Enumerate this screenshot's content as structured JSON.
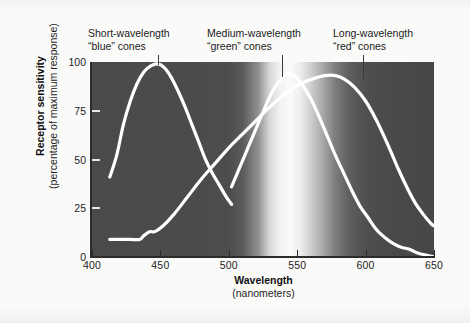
{
  "figure": {
    "background_color": "#fafaf9",
    "plot_background_dark": "#4a4a4a",
    "curve_color": "#ffffff"
  },
  "axes": {
    "x": {
      "title": "Wavelength",
      "subtitle": "(nanometers)",
      "ticks": [
        {
          "value": 400,
          "label": "400"
        },
        {
          "value": 450,
          "label": "450"
        },
        {
          "value": 500,
          "label": "500"
        },
        {
          "value": 550,
          "label": "550"
        },
        {
          "value": 600,
          "label": "600"
        },
        {
          "value": 650,
          "label": "650"
        }
      ],
      "range": [
        400,
        650
      ]
    },
    "y": {
      "title": "Receptor sensitivity",
      "subtitle": "(percentage of maximum response)",
      "ticks": [
        {
          "value": 0,
          "label": "0"
        },
        {
          "value": 25,
          "label": "25"
        },
        {
          "value": 50,
          "label": "50"
        },
        {
          "value": 75,
          "label": "75"
        },
        {
          "value": 100,
          "label": "100"
        }
      ],
      "range": [
        0,
        100
      ]
    }
  },
  "annotations": [
    {
      "id": "blue",
      "line1": "Short-wavelength",
      "line2": "“blue” cones",
      "text_left": 88,
      "text_top": 27,
      "leader_x": 158,
      "leader_top": 55,
      "leader_height": 10
    },
    {
      "id": "green",
      "line1": "Medium-wavelength",
      "line2": "“green” cones",
      "text_left": 207,
      "text_top": 27,
      "leader_x": 282,
      "leader_top": 55,
      "leader_height": 22
    },
    {
      "id": "red",
      "line1": "Long-wavelength",
      "line2": "“red” cones",
      "text_left": 333,
      "text_top": 27,
      "leader_x": 363,
      "leader_top": 55,
      "leader_height": 24
    }
  ],
  "chart_data": {
    "type": "line",
    "title": "",
    "xlabel": "Wavelength (nanometers)",
    "ylabel": "Receptor sensitivity (percentage of maximum response)",
    "xlim": [
      400,
      650
    ],
    "ylim": [
      0,
      100
    ],
    "grid": false,
    "legend_position": "annotations-above-plot",
    "background": "spectrum-grayscale-gradient",
    "series": [
      {
        "name": "Short-wavelength “blue” cones",
        "color": "#ffffff",
        "x": [
          413,
          418,
          423,
          428,
          433,
          438,
          443,
          448,
          453,
          458,
          463,
          468,
          473,
          478,
          483,
          488,
          493,
          498,
          502
        ],
        "y": [
          41,
          52,
          68,
          80,
          89,
          95,
          98,
          99,
          97,
          92,
          85,
          77,
          68,
          59,
          50,
          43,
          37,
          31,
          27
        ]
      },
      {
        "name": "Medium-wavelength “green” cones",
        "color": "#ffffff",
        "x": [
          502,
          508,
          514,
          520,
          526,
          532,
          538,
          543,
          548,
          554,
          560,
          566,
          572,
          578,
          584,
          590,
          596,
          602,
          608,
          614,
          620,
          626,
          632,
          638,
          644,
          650
        ],
        "y": [
          36,
          46,
          56,
          66,
          76,
          85,
          91,
          94,
          93,
          88,
          81,
          72,
          62,
          52,
          43,
          34,
          26,
          20,
          14,
          10,
          7,
          5,
          4,
          2,
          1,
          0
        ]
      },
      {
        "name": "Long-wavelength “red” cones",
        "color": "#ffffff",
        "x": [
          413,
          420,
          428,
          435,
          438,
          442,
          446,
          452,
          460,
          470,
          480,
          490,
          500,
          510,
          520,
          530,
          540,
          550,
          560,
          570,
          578,
          585,
          592,
          600,
          608,
          616,
          624,
          630,
          636,
          642,
          648,
          650
        ],
        "y": [
          9,
          9,
          9,
          9,
          11,
          13,
          13,
          16,
          22,
          31,
          40,
          48,
          56,
          63,
          70,
          77,
          83,
          88,
          91,
          93,
          93,
          91,
          87,
          80,
          70,
          58,
          45,
          36,
          28,
          22,
          17,
          16
        ]
      }
    ]
  }
}
